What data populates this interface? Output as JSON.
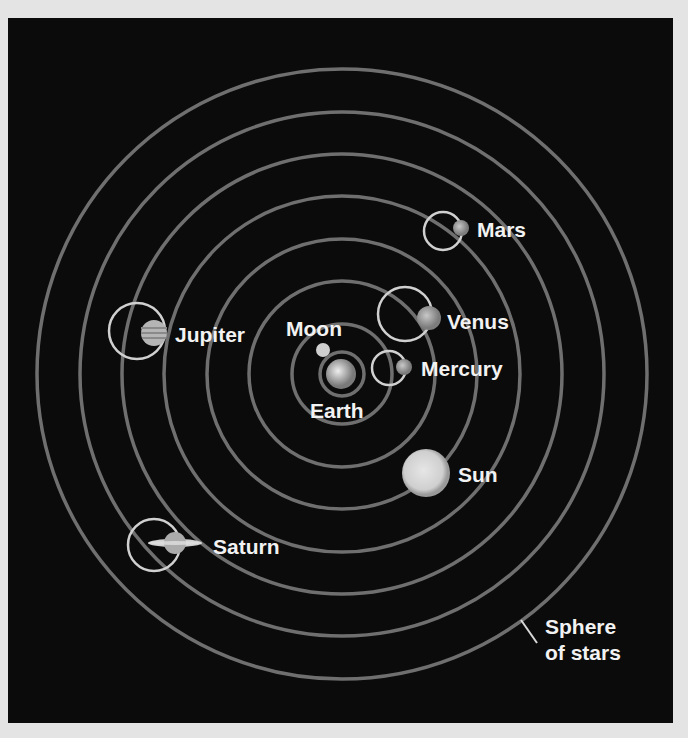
{
  "diagram": {
    "center_body": "Earth",
    "orbit_order": [
      "Moon",
      "Mercury",
      "Venus",
      "Sun",
      "Mars",
      "Jupiter",
      "Saturn",
      "Sphere of stars"
    ],
    "labels": {
      "moon": "Moon",
      "earth": "Earth",
      "mercury": "Mercury",
      "venus": "Venus",
      "mars": "Mars",
      "jupiter": "Jupiter",
      "sun": "Sun",
      "saturn": "Saturn",
      "sphere_line1": "Sphere",
      "sphere_line2": "of stars"
    },
    "colors": {
      "background": "#0b0b0b",
      "page": "#e4e4e4",
      "orbit": "#7a7a7a",
      "epicycle": "#d8d8d8",
      "text": "#f2f2f2"
    }
  }
}
